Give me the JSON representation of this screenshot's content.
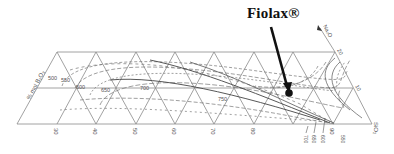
{
  "callout": {
    "label": "Fiolax®",
    "marker": "filled-dot"
  },
  "axes": {
    "left_label": "% mol B₂O₃",
    "right_arrow_label": "Na₂O",
    "right_ticks": [
      "20",
      "10"
    ],
    "bottom_right_label": "SiO₂",
    "bottom_ticks": [
      "30",
      "40",
      "50",
      "60",
      "70",
      "80",
      "90"
    ]
  },
  "isotherm_labels": {
    "left_cluster": [
      "500",
      "550",
      "600",
      "650",
      "700"
    ],
    "middle": [
      "750"
    ],
    "bottom_right": [
      "700",
      "650",
      "600",
      "550"
    ]
  },
  "colors": {
    "grid": "#8a8a8a",
    "curves": "#777777",
    "arrow": "#111111",
    "text": "#555555"
  }
}
